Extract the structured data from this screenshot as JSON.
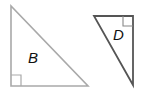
{
  "diagram": {
    "shapes": [
      {
        "id": "B",
        "label": "B",
        "type": "right-triangle",
        "vertices": [
          [
            11,
            6
          ],
          [
            11,
            86
          ],
          [
            88,
            86
          ]
        ],
        "right_angle_corner": "bottom-left",
        "stroke": "#a9a9a9"
      },
      {
        "id": "D",
        "label": "D",
        "type": "right-triangle",
        "vertices": [
          [
            94,
            16
          ],
          [
            133,
            16
          ],
          [
            133,
            85
          ]
        ],
        "right_angle_corner": "top-right",
        "stroke": "#555555"
      }
    ]
  },
  "colors": {
    "background": "#ffffff",
    "triangle_b_stroke": "#a9a9a9",
    "triangle_d_stroke": "#555555",
    "label_color": "#111111"
  }
}
